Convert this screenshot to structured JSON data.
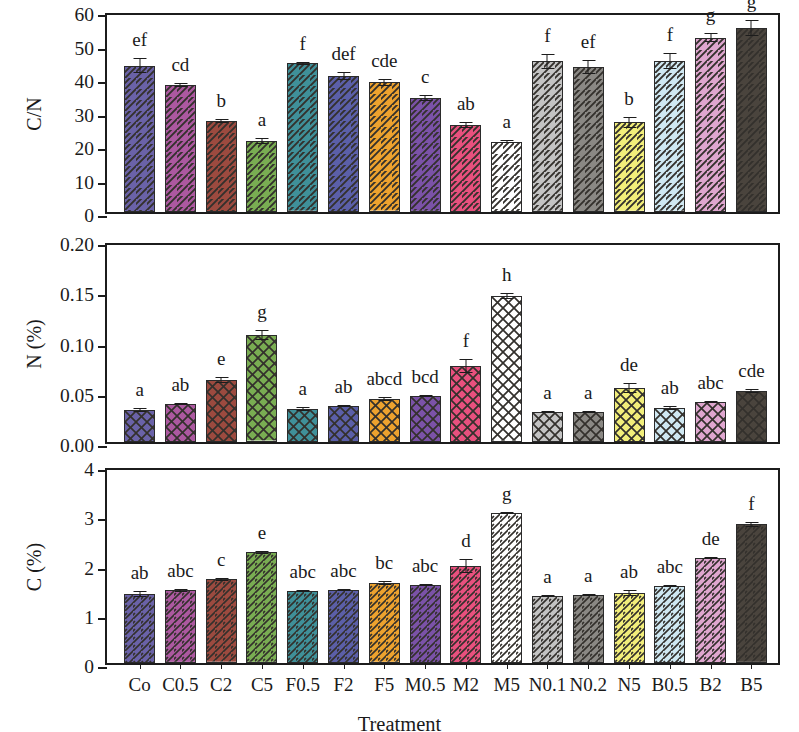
{
  "figure": {
    "x_axis_title": "Treatment",
    "categories": [
      "Co",
      "C0.5",
      "C2",
      "C5",
      "F0.5",
      "F2",
      "F5",
      "M0.5",
      "M2",
      "M5",
      "N0.1",
      "N0.2",
      "N5",
      "B0.5",
      "B2",
      "B5"
    ],
    "bar_colors": [
      "#6a62a8",
      "#ac58a0",
      "#9c4a3f",
      "#79ad52",
      "#3f9099",
      "#5b5fa8",
      "#eda22e",
      "#7b52a8",
      "#e8507e",
      "#ffffff",
      "#c3c3c3",
      "#8a8884",
      "#f2ee7a",
      "#cfe8f2",
      "#dfa6cf",
      "#4a443d"
    ]
  },
  "chart_data": [
    {
      "type": "bar",
      "panel": "top",
      "title": "",
      "ylabel": "C/N",
      "xlabel": "",
      "ylim": [
        0,
        60
      ],
      "yticks": [
        0,
        10,
        20,
        30,
        40,
        50,
        60
      ],
      "ytick_labels": [
        "0",
        "10",
        "20",
        "30",
        "40",
        "50",
        "60"
      ],
      "grid": false,
      "legend": "none",
      "categories": [
        "Co",
        "C0.5",
        "C2",
        "C5",
        "F0.5",
        "F2",
        "F5",
        "M0.5",
        "M2",
        "M5",
        "N0.1",
        "N0.2",
        "N5",
        "B0.5",
        "B2",
        "B5"
      ],
      "values": [
        43.7,
        37.9,
        27.3,
        21.2,
        44.4,
        40.7,
        38.7,
        34.0,
        26.0,
        21.0,
        45.0,
        43.3,
        26.8,
        45.0,
        52.0,
        55.0
      ],
      "errors": [
        2.2,
        0.5,
        0.6,
        0.8,
        0.4,
        1.2,
        1.0,
        0.8,
        0.8,
        0.4,
        2.2,
        2.0,
        1.6,
        2.4,
        1.4,
        2.4
      ],
      "significance_letters": [
        "ef",
        "cd",
        "b",
        "a",
        "f",
        "def",
        "cde",
        "c",
        "ab",
        "a",
        "f",
        "ef",
        "b",
        "f",
        "g",
        "g"
      ]
    },
    {
      "type": "bar",
      "panel": "middle",
      "title": "",
      "ylabel": "N (%)",
      "xlabel": "",
      "ylim": [
        0,
        0.2
      ],
      "yticks": [
        0,
        0.05,
        0.1,
        0.15,
        0.2
      ],
      "ytick_labels": [
        "0.00",
        "0.05",
        "0.10",
        "0.15",
        "0.20"
      ],
      "grid": false,
      "legend": "none",
      "categories": [
        "Co",
        "C0.5",
        "C2",
        "C5",
        "F0.5",
        "F2",
        "F5",
        "M0.5",
        "M2",
        "M5",
        "N0.1",
        "N0.2",
        "N5",
        "B0.5",
        "B2",
        "B5"
      ],
      "values": [
        0.032,
        0.038,
        0.062,
        0.106,
        0.033,
        0.036,
        0.043,
        0.046,
        0.076,
        0.145,
        0.03,
        0.03,
        0.054,
        0.034,
        0.04,
        0.051
      ],
      "errors": [
        0.002,
        0.001,
        0.003,
        0.005,
        0.002,
        0.001,
        0.002,
        0.001,
        0.007,
        0.003,
        0.001,
        0.001,
        0.005,
        0.002,
        0.001,
        0.002
      ],
      "significance_letters": [
        "a",
        "ab",
        "e",
        "g",
        "a",
        "ab",
        "abcd",
        "bcd",
        "f",
        "h",
        "a",
        "a",
        "de",
        "ab",
        "abc",
        "cde"
      ]
    },
    {
      "type": "bar",
      "panel": "bottom",
      "title": "",
      "ylabel": "C (%)",
      "xlabel": "Treatment",
      "ylim": [
        0,
        4
      ],
      "yticks": [
        0,
        1,
        2,
        3,
        4
      ],
      "ytick_labels": [
        "0",
        "1",
        "2",
        "3",
        "4"
      ],
      "grid": false,
      "legend": "none",
      "categories": [
        "Co",
        "C0.5",
        "C2",
        "C5",
        "F0.5",
        "F2",
        "F5",
        "M0.5",
        "M2",
        "M5",
        "N0.1",
        "N0.2",
        "N5",
        "B0.5",
        "B2",
        "B5"
      ],
      "values": [
        1.41,
        1.48,
        1.7,
        2.25,
        1.47,
        1.49,
        1.62,
        1.59,
        1.97,
        3.05,
        1.37,
        1.38,
        1.42,
        1.57,
        2.14,
        2.82
      ],
      "errors": [
        0.06,
        0.03,
        0.03,
        0.03,
        0.02,
        0.02,
        0.04,
        0.02,
        0.14,
        0.02,
        0.02,
        0.02,
        0.06,
        0.02,
        0.02,
        0.05
      ],
      "significance_letters": [
        "ab",
        "abc",
        "c",
        "e",
        "abc",
        "abc",
        "bc",
        "abc",
        "d",
        "g",
        "a",
        "a",
        "ab",
        "abc",
        "de",
        "f"
      ]
    }
  ]
}
